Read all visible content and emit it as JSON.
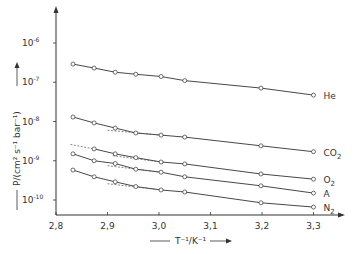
{
  "chart_data": {
    "type": "scatter",
    "title": "",
    "xlabel": "T⁻¹/K⁻¹",
    "ylabel": "P/(cm² s⁻¹ bar⁻¹)",
    "xlim": [
      2.8,
      3.35
    ],
    "ylim": [
      5e-11,
      3e-06
    ],
    "yscale": "log",
    "grid": false,
    "legend": "inline-right",
    "x_ticks": [
      {
        "value": 2.8,
        "label": "2,8"
      },
      {
        "value": 2.9,
        "label": "2,9"
      },
      {
        "value": 3.0,
        "label": "3,0"
      },
      {
        "value": 3.1,
        "label": "3,1"
      },
      {
        "value": 3.2,
        "label": "3,2"
      },
      {
        "value": 3.3,
        "label": "3,3"
      }
    ],
    "y_ticks": [
      {
        "exp": -6,
        "base": "10",
        "sup": "-6"
      },
      {
        "exp": -7,
        "base": "10",
        "sup": "-7"
      },
      {
        "exp": -8,
        "base": "10",
        "sup": "-8"
      },
      {
        "exp": -9,
        "base": "10",
        "sup": "-9"
      },
      {
        "exp": -10,
        "base": "10",
        "sup": "-10"
      }
    ],
    "series": [
      {
        "name": "He",
        "label_base": "He",
        "label_sub": "",
        "x": [
          2.833,
          2.874,
          2.915,
          2.955,
          3.004,
          3.05,
          3.198,
          3.3
        ],
        "y": [
          2.9e-07,
          2.3e-07,
          1.8e-07,
          1.6e-07,
          1.4e-07,
          1.1e-07,
          7.1e-08,
          4.7e-08
        ],
        "dashed_extrapolation": null
      },
      {
        "name": "CO2",
        "label_base": "CO",
        "label_sub": "2",
        "x": [
          2.833,
          2.874,
          2.915,
          2.955,
          3.004,
          3.05,
          3.198,
          3.3
        ],
        "y": [
          1.3e-08,
          9.2e-09,
          6.8e-09,
          5.1e-09,
          4.5e-09,
          4e-09,
          2.4e-09,
          1.7e-09
        ],
        "dashed_extrapolation": {
          "x": [
            2.9,
            3.004
          ],
          "y": [
            6e-09,
            4.5e-09
          ]
        }
      },
      {
        "name": "O2",
        "label_base": "O",
        "label_sub": "2",
        "x": [
          2.874,
          2.915,
          2.955,
          3.004,
          3.05,
          3.198,
          3.3
        ],
        "y": [
          2e-09,
          1.5e-09,
          1.2e-09,
          9.3e-10,
          8.3e-10,
          4.6e-10,
          3.4e-10
        ],
        "dashed_extrapolation": {
          "x": [
            2.828,
            2.874
          ],
          "y": [
            2.6e-09,
            2e-09
          ],
          "x2": [
            2.91,
            3.004
          ],
          "y2": [
            1.35e-09,
            9.3e-10
          ]
        }
      },
      {
        "name": "A",
        "label_base": "A",
        "label_sub": "",
        "x": [
          2.833,
          2.874,
          2.915,
          2.955,
          3.004,
          3.05,
          3.198,
          3.3
        ],
        "y": [
          1.5e-09,
          1e-09,
          8.5e-10,
          6.1e-10,
          5.1e-10,
          3.9e-10,
          2.3e-10,
          1.5e-10
        ],
        "dashed_extrapolation": {
          "x": [
            2.9,
            3.004
          ],
          "y": [
            7.5e-10,
            5.1e-10
          ]
        }
      },
      {
        "name": "N2",
        "label_base": "N",
        "label_sub": "2",
        "x": [
          2.833,
          2.874,
          2.915,
          2.955,
          3.004,
          3.05,
          3.198,
          3.3
        ],
        "y": [
          5.8e-10,
          3.9e-10,
          2.9e-10,
          2.2e-10,
          1.8e-10,
          1.6e-10,
          8.5e-11,
          6.6e-11
        ],
        "dashed_extrapolation": {
          "x": [
            2.9,
            3.004
          ],
          "y": [
            2.6e-10,
            1.8e-10
          ]
        }
      }
    ]
  }
}
